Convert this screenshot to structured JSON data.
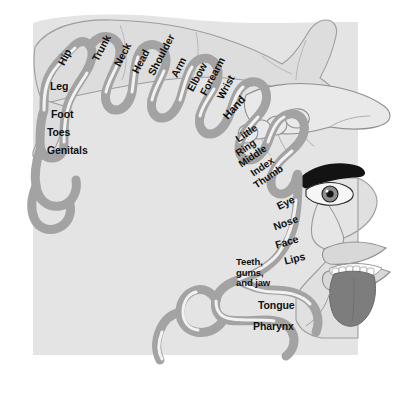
{
  "figure": {
    "colors": {
      "background": "#ffffff",
      "brain_block": "#e3e3e3",
      "cortex_band": "#a3a3a3",
      "band_highlight": "#f4f4f4",
      "band_outline": "#8c8c8c",
      "body_fill": "#dcdcdc",
      "body_outline": "#9a9a9a",
      "tongue": "#7d7d7d",
      "teeth": "#fbfbfb",
      "eye_dark": "#1a1a1a",
      "label_text": "#111111"
    }
  },
  "labels": [
    {
      "name": "hip",
      "text": "Hip",
      "x": 56,
      "y": 62,
      "rot": -62,
      "size": 10.5
    },
    {
      "name": "leg",
      "text": "Leg",
      "x": 50,
      "y": 81,
      "rot": 0,
      "size": 10.5
    },
    {
      "name": "foot",
      "text": "Foot",
      "x": 51,
      "y": 109,
      "rot": 0,
      "size": 10.5
    },
    {
      "name": "toes",
      "text": "Toes",
      "x": 47,
      "y": 127,
      "rot": 0,
      "size": 10.5
    },
    {
      "name": "genitals",
      "text": "Genitals",
      "x": 47,
      "y": 145,
      "rot": 0,
      "size": 10.5
    },
    {
      "name": "trunk",
      "text": "Trunk",
      "x": 90,
      "y": 58,
      "rot": -62,
      "size": 10.5
    },
    {
      "name": "neck",
      "text": "Neck",
      "x": 112,
      "y": 63,
      "rot": -62,
      "size": 10.5
    },
    {
      "name": "head",
      "text": "Head",
      "x": 130,
      "y": 70,
      "rot": -62,
      "size": 10.5
    },
    {
      "name": "shoulder",
      "text": "Shoulder",
      "x": 146,
      "y": 72,
      "rot": -62,
      "size": 10.5
    },
    {
      "name": "arm",
      "text": "Arm",
      "x": 169,
      "y": 74,
      "rot": -62,
      "size": 10.5
    },
    {
      "name": "elbow",
      "text": "Elbow",
      "x": 185,
      "y": 88,
      "rot": -62,
      "size": 10.5
    },
    {
      "name": "forearm",
      "text": "Forearm",
      "x": 198,
      "y": 92,
      "rot": -62,
      "size": 10.5
    },
    {
      "name": "wrist",
      "text": "Wrist",
      "x": 215,
      "y": 96,
      "rot": -62,
      "size": 10.5
    },
    {
      "name": "hand",
      "text": "Hand",
      "x": 221,
      "y": 114,
      "rot": -48,
      "size": 11
    },
    {
      "name": "little",
      "text": "Little",
      "x": 234,
      "y": 136,
      "rot": -34,
      "size": 10
    },
    {
      "name": "ring",
      "text": "Ring",
      "x": 234,
      "y": 150,
      "rot": -34,
      "size": 10
    },
    {
      "name": "middle",
      "text": "Middle",
      "x": 237,
      "y": 161,
      "rot": -34,
      "size": 10
    },
    {
      "name": "index",
      "text": "Index",
      "x": 249,
      "y": 170,
      "rot": -34,
      "size": 10
    },
    {
      "name": "thumb",
      "text": "Thumb",
      "x": 252,
      "y": 182,
      "rot": -34,
      "size": 10
    },
    {
      "name": "eye",
      "text": "Eye",
      "x": 275,
      "y": 202,
      "rot": -26,
      "size": 10.5
    },
    {
      "name": "nose",
      "text": "Nose",
      "x": 272,
      "y": 222,
      "rot": -20,
      "size": 10.5
    },
    {
      "name": "face",
      "text": "Face",
      "x": 274,
      "y": 240,
      "rot": -16,
      "size": 10.5
    },
    {
      "name": "lips",
      "text": "Lips",
      "x": 283,
      "y": 256,
      "rot": -14,
      "size": 10.5
    },
    {
      "name": "teeth-gums-jaw",
      "text": "Teeth,\ngums,\nand jaw",
      "x": 236,
      "y": 257,
      "rot": 0,
      "size": 9.5,
      "multiline": true
    },
    {
      "name": "tongue",
      "text": "Tongue",
      "x": 258,
      "y": 300,
      "rot": 0,
      "size": 10.5
    },
    {
      "name": "pharynx",
      "text": "Pharynx",
      "x": 253,
      "y": 321,
      "rot": 0,
      "size": 10.5
    }
  ],
  "illustrations": [
    {
      "name": "reclining-body-figure",
      "description": "Distorted reclining human body with raised bent arm across the top of the brain block"
    },
    {
      "name": "hand-illustration",
      "description": "Oversized hand with fingers, drawn at upper right"
    },
    {
      "name": "face-illustration",
      "description": "Face in profile with eyebrow, eye, nose, large lips, teeth and protruding tongue at right"
    }
  ]
}
